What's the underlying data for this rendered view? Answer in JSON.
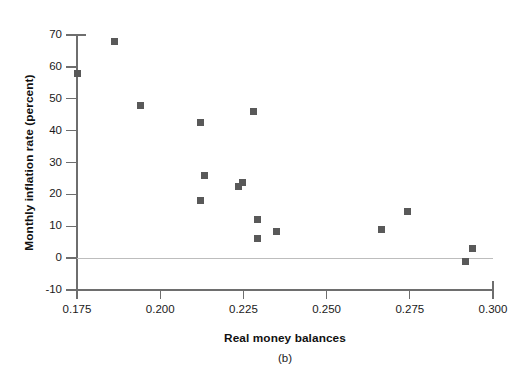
{
  "figure": {
    "panel_caption": "(b)",
    "marker_color": "#595959",
    "axis_color": "#6e6e6e",
    "zero_line_color": "#bdbdbd"
  },
  "chart_data": {
    "type": "scatter",
    "title": "",
    "subtitle": "",
    "xlabel": "Real money balances",
    "ylabel": "Monthly inflation rate (percent)",
    "panel": "(b)",
    "xlim": [
      0.175,
      0.3
    ],
    "ylim": [
      -10,
      70
    ],
    "xticks": [
      0.175,
      0.2,
      0.225,
      0.25,
      0.275,
      0.3
    ],
    "xtick_labels": [
      "0.175",
      "0.200",
      "0.225",
      "0.250",
      "0.275",
      "0.300"
    ],
    "yticks": [
      -10,
      0,
      10,
      20,
      30,
      40,
      50,
      60,
      70
    ],
    "ytick_labels": [
      "-10",
      "0",
      "10",
      "20",
      "30",
      "40",
      "50",
      "60",
      "70"
    ],
    "grid": false,
    "legend": null,
    "zero_line": true,
    "marker": "square",
    "series": [
      {
        "name": "Inflation vs real money balances",
        "points": [
          {
            "x": 0.1752,
            "y": 58
          },
          {
            "x": 0.1862,
            "y": 68
          },
          {
            "x": 0.1942,
            "y": 48
          },
          {
            "x": 0.2122,
            "y": 42.7
          },
          {
            "x": 0.2122,
            "y": 18.2
          },
          {
            "x": 0.2132,
            "y": 26
          },
          {
            "x": 0.2236,
            "y": 22.5
          },
          {
            "x": 0.2246,
            "y": 23.6
          },
          {
            "x": 0.228,
            "y": 46
          },
          {
            "x": 0.2292,
            "y": 12.1
          },
          {
            "x": 0.2292,
            "y": 6.2
          },
          {
            "x": 0.2348,
            "y": 8.2
          },
          {
            "x": 0.2666,
            "y": 9
          },
          {
            "x": 0.2744,
            "y": 14.5
          },
          {
            "x": 0.2918,
            "y": -1
          },
          {
            "x": 0.2938,
            "y": 3
          }
        ]
      }
    ]
  }
}
